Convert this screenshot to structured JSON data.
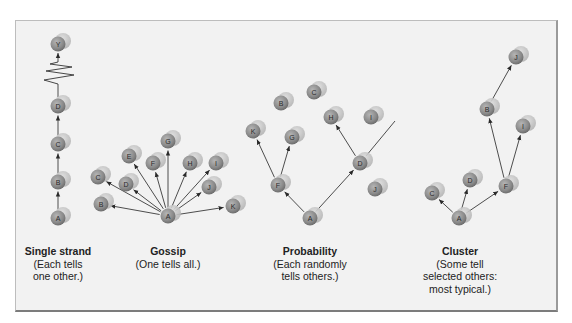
{
  "figure": {
    "colors": {
      "background": "#f2f2f2",
      "node_front": "#8a8a8a",
      "node_back": "#c4c4c4",
      "arrow": "#3a3a3a"
    },
    "networks": [
      {
        "id": "single-strand",
        "title": "Single strand",
        "description_lines": [
          "(Each tells",
          "one other.)"
        ],
        "caption_x": 58,
        "nodes": [
          {
            "id": "A",
            "x": 58,
            "y": 218
          },
          {
            "id": "B",
            "x": 58,
            "y": 182
          },
          {
            "id": "C",
            "x": 58,
            "y": 144
          },
          {
            "id": "D",
            "x": 58,
            "y": 106
          },
          {
            "id": "Y",
            "x": 58,
            "y": 44
          }
        ],
        "edges": [
          [
            "A",
            "B"
          ],
          [
            "B",
            "C"
          ],
          [
            "C",
            "D"
          ]
        ],
        "break": {
          "from_y": 90,
          "to_y": 60,
          "x": 58
        }
      },
      {
        "id": "gossip",
        "title": "Gossip",
        "description_lines": [
          "(One tells all.)"
        ],
        "caption_x": 168,
        "nodes": [
          {
            "id": "A",
            "x": 168,
            "y": 216
          },
          {
            "id": "B",
            "x": 101,
            "y": 204
          },
          {
            "id": "C",
            "x": 98,
            "y": 177
          },
          {
            "id": "D",
            "x": 126,
            "y": 184
          },
          {
            "id": "E",
            "x": 129,
            "y": 156
          },
          {
            "id": "F",
            "x": 153,
            "y": 163
          },
          {
            "id": "G",
            "x": 168,
            "y": 141
          },
          {
            "id": "H",
            "x": 190,
            "y": 163
          },
          {
            "id": "I",
            "x": 216,
            "y": 163
          },
          {
            "id": "J",
            "x": 209,
            "y": 187
          },
          {
            "id": "K",
            "x": 233,
            "y": 206
          }
        ],
        "edges": [
          [
            "A",
            "B"
          ],
          [
            "A",
            "C"
          ],
          [
            "A",
            "D"
          ],
          [
            "A",
            "E"
          ],
          [
            "A",
            "F"
          ],
          [
            "A",
            "G"
          ],
          [
            "A",
            "H"
          ],
          [
            "A",
            "I"
          ],
          [
            "A",
            "J"
          ],
          [
            "A",
            "K"
          ]
        ]
      },
      {
        "id": "probability",
        "title": "Probability",
        "description_lines": [
          "(Each randomly",
          "tells others.)"
        ],
        "caption_x": 310,
        "nodes": [
          {
            "id": "A",
            "x": 310,
            "y": 218
          },
          {
            "id": "F",
            "x": 278,
            "y": 185
          },
          {
            "id": "K",
            "x": 253,
            "y": 131
          },
          {
            "id": "G",
            "x": 292,
            "y": 137
          },
          {
            "id": "B",
            "x": 281,
            "y": 103
          },
          {
            "id": "C",
            "x": 314,
            "y": 92
          },
          {
            "id": "D",
            "x": 360,
            "y": 163
          },
          {
            "id": "H",
            "x": 331,
            "y": 117
          },
          {
            "id": "I",
            "x": 371,
            "y": 117
          },
          {
            "id": "J",
            "x": 375,
            "y": 189
          }
        ],
        "edges": [
          [
            "A",
            "F"
          ],
          [
            "F",
            "K"
          ],
          [
            "F",
            "G"
          ],
          [
            "A",
            "D"
          ],
          [
            "D",
            "H"
          ]
        ],
        "loose_edge": {
          "x1": 366,
          "y1": 156,
          "x2": 395,
          "y2": 121
        }
      },
      {
        "id": "cluster",
        "title": "Cluster",
        "description_lines": [
          "(Some tell",
          "selected others:",
          "most typical.)"
        ],
        "caption_x": 460,
        "nodes": [
          {
            "id": "A",
            "x": 459,
            "y": 218
          },
          {
            "id": "C",
            "x": 432,
            "y": 193
          },
          {
            "id": "D",
            "x": 470,
            "y": 180
          },
          {
            "id": "F",
            "x": 506,
            "y": 186
          },
          {
            "id": "B",
            "x": 487,
            "y": 109
          },
          {
            "id": "I",
            "x": 523,
            "y": 126
          },
          {
            "id": "J",
            "x": 516,
            "y": 57
          }
        ],
        "edges": [
          [
            "A",
            "C"
          ],
          [
            "A",
            "D"
          ],
          [
            "A",
            "F"
          ],
          [
            "F",
            "B"
          ],
          [
            "F",
            "I"
          ],
          [
            "B",
            "J"
          ]
        ]
      }
    ]
  }
}
